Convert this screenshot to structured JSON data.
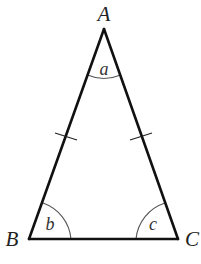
{
  "diagram": {
    "type": "isosceles-triangle",
    "vertices": {
      "A": {
        "label": "A",
        "x": 104,
        "y": 29
      },
      "B": {
        "label": "B",
        "x": 29,
        "y": 239
      },
      "C": {
        "label": "C",
        "x": 178,
        "y": 239
      }
    },
    "angles": {
      "at_A": {
        "label": "a"
      },
      "at_B": {
        "label": "b"
      },
      "at_C": {
        "label": "c"
      }
    },
    "equal_sides": [
      "AB",
      "AC"
    ],
    "tick_marks_per_equal_side": 1,
    "colors": {
      "line": "#111111",
      "arc": "#555555",
      "background": "#ffffff"
    }
  }
}
